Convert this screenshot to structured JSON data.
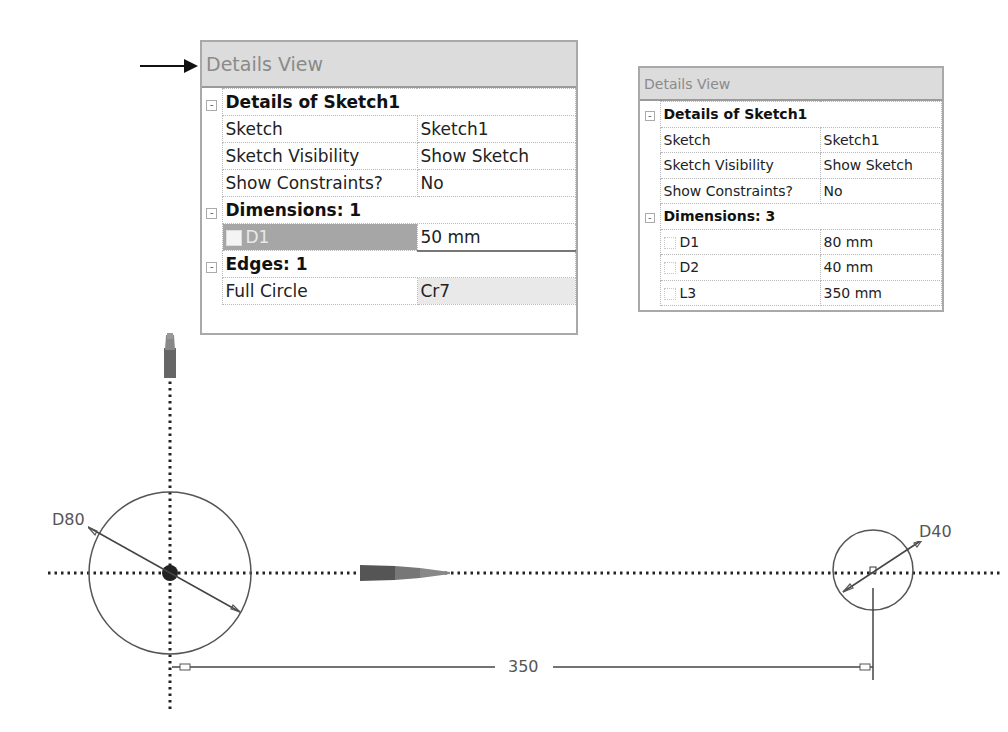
{
  "panel_large": {
    "header": "Details View",
    "sections": [
      {
        "title": "Details of Sketch1",
        "toggle": "-",
        "rows": [
          {
            "label": "Sketch",
            "value": "Sketch1"
          },
          {
            "label": "Sketch Visibility",
            "value": "Show Sketch"
          },
          {
            "label": "Show Constraints?",
            "value": "No"
          }
        ]
      },
      {
        "title": "Dimensions: 1",
        "toggle": "-",
        "rows": [
          {
            "label": "D1",
            "value": "50 mm",
            "checkbox": true,
            "selected": true
          }
        ]
      },
      {
        "title": "Edges: 1",
        "toggle": "-",
        "rows": [
          {
            "label": "Full Circle",
            "value": "Cr7"
          }
        ]
      }
    ]
  },
  "panel_small": {
    "header": "Details View",
    "sections": [
      {
        "title": "Details of Sketch1",
        "toggle": "-",
        "rows": [
          {
            "label": "Sketch",
            "value": "Sketch1"
          },
          {
            "label": "Sketch Visibility",
            "value": "Show Sketch"
          },
          {
            "label": "Show Constraints?",
            "value": "No"
          }
        ]
      },
      {
        "title": "Dimensions: 3",
        "toggle": "-",
        "rows": [
          {
            "label": "D1",
            "value": "80 mm",
            "checkbox": true
          },
          {
            "label": "D2",
            "value": "40 mm",
            "checkbox": true
          },
          {
            "label": "L3",
            "value": "350 mm",
            "checkbox": true
          }
        ]
      }
    ]
  },
  "sketch": {
    "dimension_large_circle": "D80",
    "dimension_small_circle": "D40",
    "dimension_distance": "350",
    "axes": [
      "Y-axis",
      "X-axis"
    ]
  },
  "colors": {
    "header_bg": "#dcdcdc",
    "selected_row_bg": "#a6a6a6",
    "grid_line": "#b8b8b8",
    "sketch_line": "#555555"
  }
}
